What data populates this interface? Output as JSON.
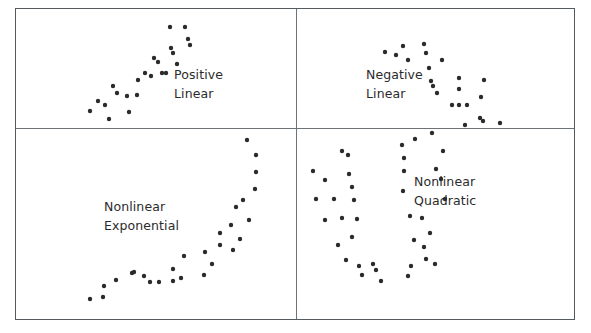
{
  "figure": {
    "background_color": "#ffffff",
    "frame_color": "#555a5e",
    "divider_color": "#6d7276",
    "dot_color": "#2b2b2b",
    "dot_radius": 2.2
  },
  "chart_data": {
    "type": "scatter",
    "title": "",
    "xlabel": "",
    "ylabel": "",
    "grid": false,
    "legend_position": "none",
    "layout": {
      "rows": 2,
      "cols": 2
    },
    "panels": [
      {
        "name": "positive-linear",
        "label_lines": [
          "Positive",
          "Linear"
        ],
        "relationship": "positive linear",
        "xlim": [
          0,
          279
        ],
        "ylim": [
          0,
          118
        ],
        "points": [
          [
            73,
            101
          ],
          [
            81,
            91
          ],
          [
            88,
            95
          ],
          [
            92,
            109
          ],
          [
            96,
            76
          ],
          [
            100,
            83
          ],
          [
            110,
            86
          ],
          [
            112,
            102
          ],
          [
            120,
            85
          ],
          [
            121,
            70
          ],
          [
            128,
            63
          ],
          [
            134,
            66
          ],
          [
            137,
            48
          ],
          [
            141,
            52
          ],
          [
            145,
            63
          ],
          [
            149,
            63
          ],
          [
            153,
            17
          ],
          [
            154,
            38
          ],
          [
            156,
            43
          ],
          [
            160,
            54
          ],
          [
            168,
            17
          ],
          [
            171,
            29
          ],
          [
            173,
            35
          ]
        ]
      },
      {
        "name": "negative-linear",
        "label_lines": [
          "Negative",
          "Linear"
        ],
        "relationship": "negative linear",
        "xlim": [
          0,
          277
        ],
        "ylim": [
          0,
          118
        ],
        "points": [
          [
            88,
            42
          ],
          [
            99,
            45
          ],
          [
            106,
            36
          ],
          [
            111,
            50
          ],
          [
            127,
            34
          ],
          [
            129,
            43
          ],
          [
            132,
            58
          ],
          [
            145,
            50
          ],
          [
            134,
            71
          ],
          [
            136,
            76
          ],
          [
            140,
            83
          ],
          [
            162,
            68
          ],
          [
            162,
            79
          ],
          [
            155,
            95
          ],
          [
            162,
            95
          ],
          [
            170,
            95
          ],
          [
            187,
            70
          ],
          [
            184,
            87
          ],
          [
            183,
            108
          ],
          [
            186,
            111
          ],
          [
            168,
            115
          ],
          [
            203,
            113
          ]
        ]
      },
      {
        "name": "nonlinear-exponential",
        "label_lines": [
          "Nonlinear",
          "Exponential"
        ],
        "relationship": "nonlinear exponential",
        "xlim": [
          0,
          279
        ],
        "ylim": [
          0,
          190
        ],
        "points": [
          [
            73,
            170
          ],
          [
            86,
            168
          ],
          [
            87,
            157
          ],
          [
            99,
            151
          ],
          [
            115,
            144
          ],
          [
            117,
            143
          ],
          [
            127,
            147
          ],
          [
            133,
            153
          ],
          [
            142,
            153
          ],
          [
            156,
            152
          ],
          [
            156,
            140
          ],
          [
            164,
            149
          ],
          [
            167,
            127
          ],
          [
            187,
            146
          ],
          [
            188,
            123
          ],
          [
            195,
            135
          ],
          [
            203,
            116
          ],
          [
            203,
            104
          ],
          [
            216,
            121
          ],
          [
            214,
            96
          ],
          [
            219,
            78
          ],
          [
            223,
            110
          ],
          [
            226,
            71
          ],
          [
            232,
            91
          ],
          [
            238,
            60
          ],
          [
            239,
            43
          ],
          [
            239,
            26
          ],
          [
            230,
            11
          ]
        ]
      },
      {
        "name": "nonlinear-quadratic",
        "label_lines": [
          "Nonlinear",
          "Quadratic"
        ],
        "relationship": "nonlinear quadratic",
        "xlim": [
          0,
          277
        ],
        "ylim": [
          0,
          190
        ],
        "points": [
          [
            45,
            22
          ],
          [
            51,
            26
          ],
          [
            16,
            42
          ],
          [
            28,
            51
          ],
          [
            52,
            45
          ],
          [
            55,
            58
          ],
          [
            19,
            70
          ],
          [
            37,
            70
          ],
          [
            57,
            71
          ],
          [
            28,
            91
          ],
          [
            45,
            89
          ],
          [
            60,
            90
          ],
          [
            41,
            116
          ],
          [
            55,
            108
          ],
          [
            49,
            131
          ],
          [
            62,
            137
          ],
          [
            65,
            146
          ],
          [
            76,
            135
          ],
          [
            79,
            141
          ],
          [
            84,
            152
          ],
          [
            114,
            137
          ],
          [
            111,
            147
          ],
          [
            129,
            130
          ],
          [
            138,
            135
          ],
          [
            113,
            87
          ],
          [
            125,
            89
          ],
          [
            133,
            104
          ],
          [
            117,
            111
          ],
          [
            127,
            118
          ],
          [
            106,
            62
          ],
          [
            107,
            42
          ],
          [
            107,
            29
          ],
          [
            105,
            16
          ],
          [
            118,
            10
          ],
          [
            135,
            4
          ],
          [
            139,
            40
          ],
          [
            144,
            50
          ],
          [
            146,
            22
          ],
          [
            148,
            70
          ]
        ]
      }
    ]
  }
}
